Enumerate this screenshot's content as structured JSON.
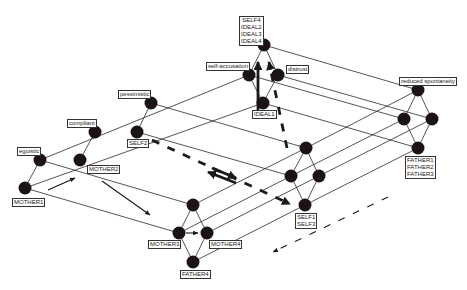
{
  "colors": {
    "background": "#ffffff",
    "node": "#1c1414",
    "edge": "#2a2a2a",
    "arrow": "#1a1a1a"
  },
  "nodes": [
    {
      "id": "n_mother1",
      "x": 25,
      "y": 188
    },
    {
      "id": "n_egoistic",
      "x": 40,
      "y": 160
    },
    {
      "id": "n_mother2",
      "x": 80,
      "y": 160
    },
    {
      "id": "n_compliant",
      "x": 95,
      "y": 132
    },
    {
      "id": "n_self2",
      "x": 137,
      "y": 132
    },
    {
      "id": "n_pessimistic",
      "x": 151,
      "y": 103
    },
    {
      "id": "n_ideal1",
      "x": 263,
      "y": 103
    },
    {
      "id": "n_selfaccusation",
      "x": 249,
      "y": 75
    },
    {
      "id": "n_distrust",
      "x": 278,
      "y": 75
    },
    {
      "id": "n_top",
      "x": 264,
      "y": 45
    },
    {
      "id": "n_b_top",
      "x": 193,
      "y": 205
    },
    {
      "id": "n_mother3",
      "x": 179,
      "y": 233
    },
    {
      "id": "n_mother4",
      "x": 207,
      "y": 233
    },
    {
      "id": "n_father4",
      "x": 193,
      "y": 262
    },
    {
      "id": "n_s_top",
      "x": 306,
      "y": 148
    },
    {
      "id": "n_s_left",
      "x": 291,
      "y": 176
    },
    {
      "id": "n_s_right",
      "x": 319,
      "y": 176
    },
    {
      "id": "n_self13",
      "x": 305,
      "y": 205
    },
    {
      "id": "n_reduced",
      "x": 418,
      "y": 90
    },
    {
      "id": "n_r_left",
      "x": 404,
      "y": 119
    },
    {
      "id": "n_r_right",
      "x": 432,
      "y": 119
    },
    {
      "id": "n_father123",
      "x": 418,
      "y": 148
    }
  ],
  "edges": [
    [
      "n_mother1",
      "n_egoistic"
    ],
    [
      "n_mother2",
      "n_compliant"
    ],
    [
      "n_self2",
      "n_pessimistic"
    ],
    [
      "n_ideal1",
      "n_selfaccusation"
    ],
    [
      "n_ideal1",
      "n_distrust"
    ],
    [
      "n_selfaccusation",
      "n_top"
    ],
    [
      "n_distrust",
      "n_top"
    ],
    [
      "n_mother1",
      "n_ideal1"
    ],
    [
      "n_egoistic",
      "n_selfaccusation"
    ],
    [
      "n_mother1",
      "n_mother3"
    ],
    [
      "n_egoistic",
      "n_b_top"
    ],
    [
      "n_pessimistic",
      "n_s_top"
    ],
    [
      "n_self2",
      "n_s_left"
    ],
    [
      "n_b_top",
      "n_mother3"
    ],
    [
      "n_b_top",
      "n_mother4"
    ],
    [
      "n_mother3",
      "n_father4"
    ],
    [
      "n_mother4",
      "n_father4"
    ],
    [
      "n_s_top",
      "n_s_left"
    ],
    [
      "n_s_top",
      "n_s_right"
    ],
    [
      "n_s_left",
      "n_self13"
    ],
    [
      "n_s_right",
      "n_self13"
    ],
    [
      "n_reduced",
      "n_r_left"
    ],
    [
      "n_reduced",
      "n_r_right"
    ],
    [
      "n_r_left",
      "n_father123"
    ],
    [
      "n_r_right",
      "n_father123"
    ],
    [
      "n_b_top",
      "n_s_top"
    ],
    [
      "n_mother3",
      "n_s_left"
    ],
    [
      "n_mother4",
      "n_s_right"
    ],
    [
      "n_father4",
      "n_self13"
    ],
    [
      "n_s_top",
      "n_reduced"
    ],
    [
      "n_s_left",
      "n_r_left"
    ],
    [
      "n_s_right",
      "n_r_right"
    ],
    [
      "n_self13",
      "n_father123"
    ],
    [
      "n_top",
      "n_reduced"
    ],
    [
      "n_selfaccusation",
      "n_r_left"
    ],
    [
      "n_distrust",
      "n_r_right"
    ],
    [
      "n_ideal1",
      "n_father123"
    ]
  ],
  "arrows": [
    {
      "kind": "thin-solid",
      "x1": 48,
      "y1": 190,
      "x2": 75,
      "y2": 178
    },
    {
      "kind": "thin-solid",
      "x1": 102,
      "y1": 181,
      "x2": 150,
      "y2": 215
    },
    {
      "kind": "thin-solid",
      "x1": 186,
      "y1": 233,
      "x2": 198,
      "y2": 233
    },
    {
      "kind": "thick-solid",
      "x1": 258,
      "y1": 112,
      "x2": 258,
      "y2": 62
    },
    {
      "kind": "thick-dashed",
      "x1": 287,
      "y1": 148,
      "x2": 269,
      "y2": 62
    },
    {
      "kind": "thick-dashed",
      "x1": 152,
      "y1": 140,
      "x2": 290,
      "y2": 204
    },
    {
      "kind": "thick-solid",
      "x1": 212,
      "y1": 168,
      "x2": 236,
      "y2": 178
    },
    {
      "kind": "thick-solid",
      "x1": 236,
      "y1": 183,
      "x2": 208,
      "y2": 172
    },
    {
      "kind": "thin-dashed",
      "x1": 388,
      "y1": 197,
      "x2": 273,
      "y2": 252
    }
  ],
  "labels": [
    {
      "id": "lbl_egoistic",
      "lines": [
        "egoistic"
      ],
      "x": 17,
      "y": 147
    },
    {
      "id": "lbl_compliant",
      "lines": [
        "compliant"
      ],
      "x": 67,
      "y": 119
    },
    {
      "id": "lbl_pessimistic",
      "lines": [
        "pessimistic"
      ],
      "x": 118,
      "y": 90
    },
    {
      "id": "lbl_selfaccusation",
      "lines": [
        "self-accusation"
      ],
      "x": 206,
      "y": 62
    },
    {
      "id": "lbl_distrust",
      "lines": [
        "distrust"
      ],
      "x": 286,
      "y": 65
    },
    {
      "id": "lbl_top",
      "lines": [
        "SELF4",
        "IDEAL2",
        "IDEAL3",
        "IDEAL4"
      ],
      "x": 239,
      "y": 16
    },
    {
      "id": "lbl_ideal1",
      "lines": [
        "IDEAL1"
      ],
      "x": 252,
      "y": 110
    },
    {
      "id": "lbl_self2",
      "lines": [
        "SELF2"
      ],
      "x": 127,
      "y": 139
    },
    {
      "id": "lbl_mother2",
      "lines": [
        "MOTHER2"
      ],
      "x": 87,
      "y": 165
    },
    {
      "id": "lbl_mother1",
      "lines": [
        "MOTHER1"
      ],
      "x": 12,
      "y": 198
    },
    {
      "id": "lbl_reduced",
      "lines": [
        "reduced spontaneity"
      ],
      "x": 399,
      "y": 77
    },
    {
      "id": "lbl_father123",
      "lines": [
        "FATHER1",
        "FATHER2",
        "FATHER3"
      ],
      "x": 405,
      "y": 156
    },
    {
      "id": "lbl_self13",
      "lines": [
        "SELF1",
        "SELF3"
      ],
      "x": 295,
      "y": 213
    },
    {
      "id": "lbl_mother3",
      "lines": [
        "MOTHER3"
      ],
      "x": 148,
      "y": 240
    },
    {
      "id": "lbl_mother4",
      "lines": [
        "MOTHER4"
      ],
      "x": 209,
      "y": 240
    },
    {
      "id": "lbl_father4",
      "lines": [
        "FATHER4"
      ],
      "x": 180,
      "y": 270
    }
  ]
}
